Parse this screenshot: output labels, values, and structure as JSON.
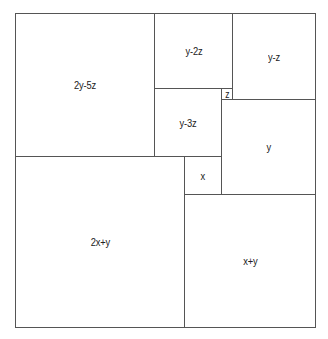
{
  "diagram": {
    "type": "squared-square-dissection",
    "line_color": "#555555",
    "background": "#ffffff",
    "outer": {
      "left": 15,
      "top": 13,
      "width": 301,
      "height": 315
    },
    "squares": [
      {
        "id": "sq-2y-5z",
        "label": "2y-5z",
        "left": 15,
        "top": 13,
        "width": 140,
        "height": 144
      },
      {
        "id": "sq-y-2z",
        "label": "y-2z",
        "left": 154,
        "top": 13,
        "width": 79,
        "height": 76
      },
      {
        "id": "sq-y-z",
        "label": "y-z",
        "left": 232,
        "top": 13,
        "width": 84,
        "height": 87
      },
      {
        "id": "sq-y-3z",
        "label": "y-3z",
        "left": 154,
        "top": 88,
        "width": 68,
        "height": 69
      },
      {
        "id": "sq-z",
        "label": "z",
        "left": 221,
        "top": 88,
        "width": 12,
        "height": 12
      },
      {
        "id": "sq-y",
        "label": "y",
        "left": 221,
        "top": 99,
        "width": 95,
        "height": 96
      },
      {
        "id": "sq-x",
        "label": "x",
        "left": 184,
        "top": 156,
        "width": 38,
        "height": 39
      },
      {
        "id": "sq-2x+y",
        "label": "2x+y",
        "left": 15,
        "top": 156,
        "width": 170,
        "height": 172
      },
      {
        "id": "sq-x+y",
        "label": "x+y",
        "left": 184,
        "top": 194,
        "width": 132,
        "height": 134
      }
    ]
  }
}
